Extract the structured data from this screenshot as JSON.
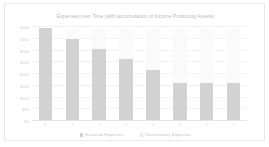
{
  "chart_data": {
    "type": "bar",
    "title": "Expenses over Time (with accumulation of Income Producing Assets)",
    "xlabel": "",
    "ylabel": "",
    "stacked": true,
    "grid": true,
    "legend_position": "bottom",
    "categories": [
      "0",
      "1",
      "2",
      "3",
      "4",
      "5",
      "6",
      "7"
    ],
    "ylim": [
      0,
      400
    ],
    "yticks": [
      0,
      50,
      100,
      150,
      200,
      250,
      300,
      350,
      400
    ],
    "ytick_labels": [
      "$0",
      "$50",
      "$100",
      "$150",
      "$200",
      "$250",
      "$300",
      "$350",
      "$400"
    ],
    "series": [
      {
        "name": "Essential Expenses",
        "color": "#d2d2d2",
        "values": [
          395,
          350,
          305,
          265,
          215,
          160,
          160,
          160
        ]
      },
      {
        "name": "Discretionary Expenses",
        "color": "#fafafa",
        "values": [
          0,
          40,
          85,
          125,
          175,
          230,
          230,
          230
        ]
      }
    ]
  },
  "legend": {
    "entries": [
      {
        "label": "Essential Expenses"
      },
      {
        "label": "Discretionary Expenses"
      }
    ]
  },
  "colors": {
    "essential": "#d2d2d2",
    "discretionary": "#fafafa",
    "gridline": "#f2f2f2",
    "text": "#c6c6c6",
    "frame": "#e8e8e8",
    "background": "#ffffff"
  }
}
